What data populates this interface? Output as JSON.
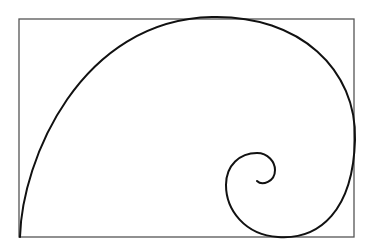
{
  "diagram": {
    "type": "golden-spiral",
    "background": "#ffffff",
    "rectangle": {
      "x": 19,
      "y": 19,
      "width": 335,
      "height": 218,
      "stroke": "#555555",
      "stroke_width": 1.3
    },
    "spiral": {
      "stroke": "#111111",
      "stroke_width": 2,
      "path": "M20,237 C22,160 80,20 212,17 C300,15 357,70 355,140 C353,210 320,240 278,237 C245,235 226,210 226,185 C226,165 240,153 257,153 C268,153 275,162 275,170 C275,182 262,186 257,181"
    }
  }
}
